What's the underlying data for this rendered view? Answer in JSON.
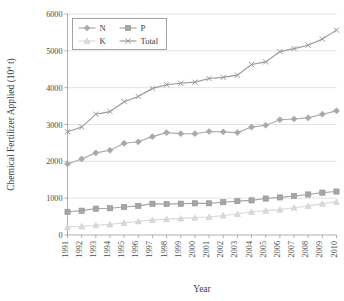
{
  "chart_data": {
    "type": "line",
    "title": "",
    "xlabel": "Year",
    "ylabel": "Chemical Fertilizer Applied (10⁴ t)",
    "ylabel_base": "Chemical Fertilizer Applied (10",
    "ylabel_exp": "4",
    "ylabel_tail": " t)",
    "categories": [
      "1991",
      "1992",
      "1993",
      "1994",
      "1995",
      "1996",
      "1997",
      "1998",
      "1999",
      "2000",
      "2001",
      "2002",
      "2003",
      "2004",
      "2005",
      "2006",
      "2007",
      "2008",
      "2009",
      "2010"
    ],
    "ylim": [
      0,
      6000
    ],
    "yticks": [
      0,
      1000,
      2000,
      3000,
      4000,
      5000,
      6000
    ],
    "ytick_labels": [
      "0",
      "1000",
      "2000",
      "3000",
      "4000",
      "5000",
      "6000"
    ],
    "grid": true,
    "grid_axis": "y",
    "legend_position": "top-left-inside",
    "series": [
      {
        "name": "N",
        "marker": "diamond",
        "color": "#a8a8a8",
        "values": [
          1927,
          2065,
          2230,
          2300,
          2490,
          2530,
          2670,
          2780,
          2750,
          2750,
          2810,
          2800,
          2780,
          2930,
          2980,
          3130,
          3150,
          3180,
          3280,
          3370
        ]
      },
      {
        "name": "P",
        "marker": "square",
        "color": "#a6a6a6",
        "values": [
          630,
          660,
          715,
          725,
          760,
          790,
          850,
          840,
          850,
          860,
          860,
          890,
          920,
          940,
          990,
          1020,
          1060,
          1100,
          1150,
          1180
        ]
      },
      {
        "name": "K",
        "marker": "triangle",
        "color": "#d9d9d9",
        "values": [
          220,
          235,
          265,
          290,
          330,
          370,
          410,
          430,
          450,
          470,
          490,
          530,
          570,
          630,
          660,
          690,
          740,
          790,
          850,
          900
        ]
      },
      {
        "name": "Total",
        "marker": "cross",
        "color": "#999999",
        "values": [
          2805,
          2930,
          3280,
          3350,
          3620,
          3760,
          3980,
          4080,
          4120,
          4150,
          4250,
          4280,
          4340,
          4630,
          4700,
          4980,
          5060,
          5150,
          5320,
          5562
        ]
      }
    ]
  },
  "legend": {
    "items": [
      {
        "label": "N",
        "marker": "diamond",
        "color": "#a8a8a8"
      },
      {
        "label": "P",
        "marker": "square",
        "color": "#a6a6a6"
      },
      {
        "label": "K",
        "marker": "triangle",
        "color": "#d9d9d9"
      },
      {
        "label": "Total",
        "marker": "cross",
        "color": "#999999"
      }
    ]
  }
}
